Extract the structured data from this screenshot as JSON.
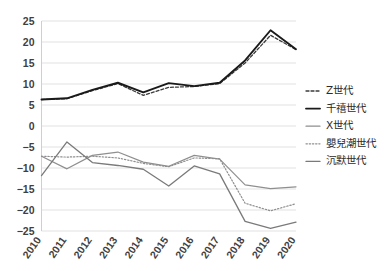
{
  "chart_data": {
    "type": "line",
    "title": "",
    "xlabel": "",
    "ylabel": "",
    "categories": [
      "2010",
      "2011",
      "2012",
      "2013",
      "2014",
      "2015",
      "2016",
      "2017",
      "2018",
      "2019",
      "2020"
    ],
    "x": [
      2010,
      2011,
      2012,
      2013,
      2014,
      2015,
      2016,
      2017,
      2018,
      2019,
      2020
    ],
    "ylim": [
      -25,
      25
    ],
    "ytick_values": [
      25,
      20,
      15,
      10,
      5,
      0,
      -5,
      -10,
      -15,
      -20,
      -25
    ],
    "ytick_labels": [
      "25",
      "20",
      "15",
      "10",
      "5",
      "0",
      "−5",
      "−10",
      "−15",
      "−20",
      "−25"
    ],
    "grid": true,
    "legend_position": "right",
    "series": [
      {
        "name": "Z世代",
        "style": "dashed",
        "color": "#3a3a3a",
        "width": 1.3,
        "dash": "3,2",
        "values": [
          6.3,
          6.5,
          8.4,
          10.1,
          7.3,
          9.2,
          9.4,
          10.1,
          15.0,
          21.6,
          18.2
        ]
      },
      {
        "name": "千禧世代",
        "style": "solid",
        "color": "#1a1a1a",
        "width": 1.9,
        "dash": "none",
        "values": [
          6.3,
          6.6,
          8.6,
          10.3,
          8.0,
          10.2,
          9.5,
          10.3,
          15.6,
          22.8,
          18.3
        ]
      },
      {
        "name": "X世代",
        "style": "solid",
        "color": "#8f8f8f",
        "width": 1.2,
        "dash": "none",
        "values": [
          -7.2,
          -10.2,
          -7.0,
          -6.2,
          -8.6,
          -9.6,
          -7.0,
          -7.9,
          -14.0,
          -14.9,
          -14.5
        ]
      },
      {
        "name": "嬰兒潮世代",
        "style": "dotted",
        "color": "#8f8f8f",
        "width": 1.2,
        "dash": "1.4,1.8",
        "values": [
          -7.2,
          -7.4,
          -7.2,
          -7.6,
          -8.9,
          -9.7,
          -7.6,
          -7.8,
          -18.4,
          -20.2,
          -18.5
        ]
      },
      {
        "name": "沉默世代",
        "style": "solid",
        "color": "#7a7a7a",
        "width": 1.3,
        "dash": "none",
        "values": [
          -11.8,
          -3.8,
          -8.7,
          -9.4,
          -10.3,
          -14.3,
          -9.5,
          -11.4,
          -22.7,
          -24.4,
          -22.9
        ]
      }
    ]
  },
  "legend": {
    "items": [
      {
        "label": "Z世代"
      },
      {
        "label": "千禧世代"
      },
      {
        "label": "X世代"
      },
      {
        "label": "嬰兒潮世代"
      },
      {
        "label": "沉默世代"
      }
    ]
  }
}
